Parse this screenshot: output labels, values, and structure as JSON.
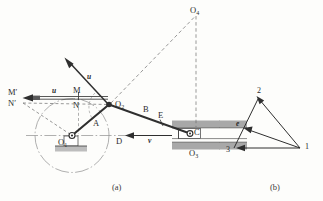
{
  "figure": {
    "captions": [
      {
        "id": "caption-a",
        "text": "(a)"
      },
      {
        "id": "caption-b",
        "text": "(b)"
      }
    ]
  },
  "mechanism": {
    "joints": [
      {
        "name": "O1",
        "text": "O",
        "sub": "1"
      },
      {
        "name": "O2",
        "text": "O",
        "sub": "2"
      },
      {
        "name": "O3",
        "text": "O",
        "sub": "3"
      },
      {
        "name": "O4",
        "text": "O",
        "sub": "4"
      },
      {
        "name": "C",
        "text": "C",
        "sub": ""
      },
      {
        "name": "D",
        "text": "D",
        "sub": ""
      },
      {
        "name": "E",
        "text": "E",
        "sub": ""
      },
      {
        "name": "M",
        "text": "M",
        "sub": ""
      },
      {
        "name": "N",
        "text": "N",
        "sub": ""
      },
      {
        "name": "Mprime",
        "text": "M′",
        "sub": ""
      },
      {
        "name": "Nprime",
        "text": "N′",
        "sub": ""
      }
    ],
    "links": [
      {
        "name": "link-A",
        "label": "A"
      },
      {
        "name": "link-B",
        "label": "B"
      }
    ],
    "vectors": [
      {
        "name": "u-diagonal",
        "label": "u"
      },
      {
        "name": "u-horizontal",
        "label": "u"
      },
      {
        "name": "v-slider",
        "label": "v"
      }
    ]
  },
  "velocity_diagram": {
    "vertices": [
      {
        "name": "vertex-1",
        "label": "1"
      },
      {
        "name": "vertex-2",
        "label": "2"
      },
      {
        "name": "vertex-3",
        "label": "3"
      },
      {
        "name": "point-e",
        "label": "e"
      }
    ]
  },
  "colors": {
    "line": "#2f2f2f",
    "construction": "#6d6d6d",
    "hatch": "#9a9a9a",
    "ground": "#b0b0b0",
    "background": "#fdfdfb"
  }
}
